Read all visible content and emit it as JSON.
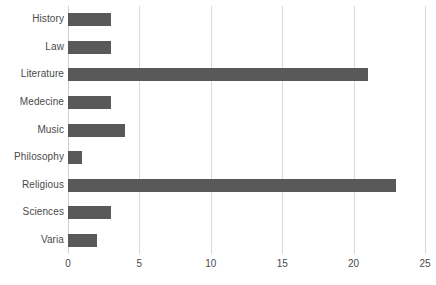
{
  "chart_data": {
    "type": "bar",
    "orientation": "horizontal",
    "title": "",
    "subtitle": "",
    "xlabel": "",
    "ylabel": "",
    "categories": [
      "History",
      "Law",
      "Literature",
      "Medecine",
      "Music",
      "Philosophy",
      "Religious",
      "Sciences",
      "Varia"
    ],
    "values": [
      3,
      3,
      21,
      3,
      4,
      1,
      23,
      3,
      2
    ],
    "xlim": [
      0,
      25
    ],
    "xticks": [
      0,
      5,
      10,
      15,
      20,
      25
    ],
    "xtick_labels": [
      "0",
      "5",
      "10",
      "15",
      "20",
      "25"
    ],
    "grid": "vertical",
    "legend": "none",
    "bar_color": "#595959",
    "gridline_color": "#d9d9d9",
    "text_color": "#4a4a4a",
    "background_color": "#ffffff"
  }
}
